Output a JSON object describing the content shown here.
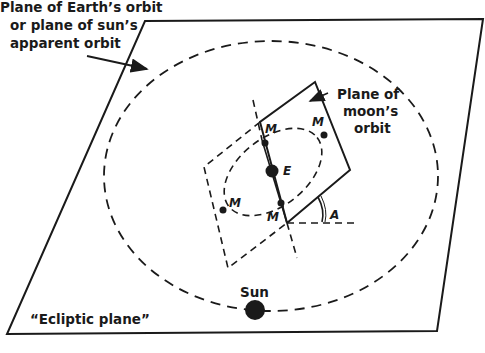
{
  "labels": {
    "earth_orbit_plane": [
      "Plane of Earth’s orbit",
      "or plane of sun’s",
      "apparent orbit"
    ],
    "moon_orbit_plane": [
      "Plane of",
      "moon’s",
      "orbit"
    ],
    "ecliptic": "“Ecliptic plane”",
    "sun": "Sun",
    "earth": "E",
    "moon": "M",
    "angle": "A"
  },
  "colors": {
    "ink": "#1a1a1a",
    "background": "#ffffff"
  }
}
